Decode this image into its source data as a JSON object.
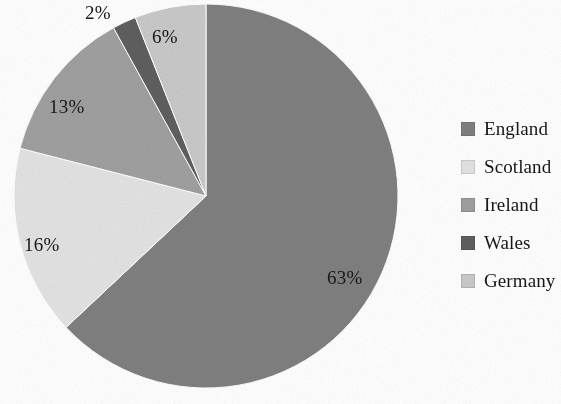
{
  "chart_data": {
    "type": "pie",
    "title": "",
    "subtitle": "",
    "xlabel": "",
    "ylabel": "",
    "legend_position": "right",
    "grid": false,
    "start_angle_deg": 0,
    "direction": "clockwise",
    "units": "percent",
    "categories": [
      "England",
      "Scotland",
      "Ireland",
      "Wales",
      "Germany"
    ],
    "values": [
      63,
      16,
      13,
      2,
      6
    ],
    "data_labels": [
      "63%",
      "16%",
      "13%",
      "2%",
      "6%"
    ],
    "colors": [
      "#808080",
      "#e3e3e3",
      "#a0a0a0",
      "#5f5f5f",
      "#c9c9c9"
    ],
    "slices": [
      {
        "label": "England",
        "value": 63,
        "data_label": "63%",
        "color": "#808080",
        "label_placement": "inside"
      },
      {
        "label": "Scotland",
        "value": 16,
        "data_label": "16%",
        "color": "#e3e3e3",
        "label_placement": "inside"
      },
      {
        "label": "Ireland",
        "value": 13,
        "data_label": "13%",
        "color": "#a0a0a0",
        "label_placement": "inside"
      },
      {
        "label": "Wales",
        "value": 2,
        "data_label": "2%",
        "color": "#5f5f5f",
        "label_placement": "outside"
      },
      {
        "label": "Germany",
        "value": 6,
        "data_label": "6%",
        "color": "#c9c9c9",
        "label_placement": "inside"
      }
    ]
  },
  "legend": {
    "items": [
      {
        "label": "England",
        "color": "#808080"
      },
      {
        "label": "Scotland",
        "color": "#e3e3e3"
      },
      {
        "label": "Ireland",
        "color": "#a0a0a0"
      },
      {
        "label": "Wales",
        "color": "#5f5f5f"
      },
      {
        "label": "Germany",
        "color": "#c9c9c9"
      }
    ]
  },
  "labels": {
    "england": "63%",
    "scotland": "16%",
    "ireland": "13%",
    "wales": "2%",
    "germany": "6%"
  },
  "style": {
    "background": "#ffffff",
    "text_color": "#171717"
  }
}
